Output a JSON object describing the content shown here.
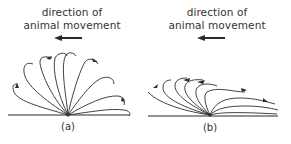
{
  "figure": {
    "panels": [
      {
        "id": "a",
        "label": "(a)",
        "caption_line1": "direction of",
        "caption_line2": "animal movement",
        "arrow_direction": "left",
        "description": "Fan of looping paths radiating from a single ground point, spread evenly over a semicircle (symmetric, upright)."
      },
      {
        "id": "b",
        "label": "(b)",
        "caption_line1": "direction of",
        "caption_line2": "animal movement",
        "arrow_direction": "left",
        "description": "Fan of looping paths radiating from a single ground point, swept back and flattened toward the ground (asymmetric)."
      }
    ],
    "colors": {
      "line": "#2b2b2b",
      "text": "#333333",
      "background": "#ffffff"
    }
  }
}
